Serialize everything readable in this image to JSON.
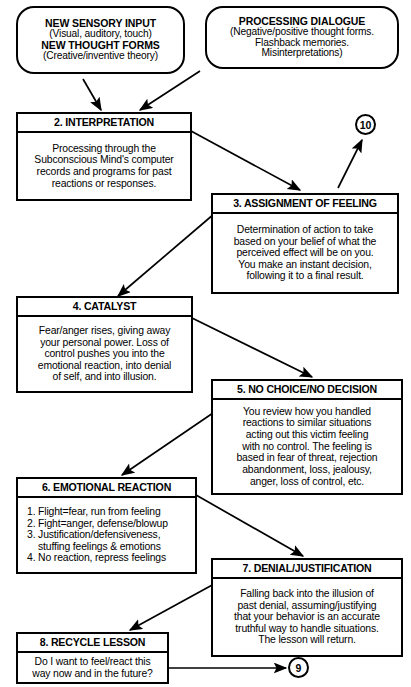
{
  "diagram": {
    "background": "#ffffff",
    "line_color": "#000000"
  },
  "inputs": [
    {
      "id": "new-sensory-input",
      "lines": [
        {
          "text": "NEW SENSORY INPUT",
          "style": "strong"
        },
        {
          "text": "(Visual, auditory, touch)",
          "style": "plain"
        },
        {
          "text": "NEW THOUGHT FORMS",
          "style": "strong"
        },
        {
          "text": "(Creative/inventive theory)",
          "style": "plain"
        }
      ]
    },
    {
      "id": "processing-dialogue",
      "lines": [
        {
          "text": "PROCESSING DIALOGUE",
          "style": "strong"
        },
        {
          "text": "(Negative/positive thought forms.",
          "style": "plain"
        },
        {
          "text": "Flashback memories.",
          "style": "plain"
        },
        {
          "text": "Misinterpretations)",
          "style": "plain"
        }
      ]
    }
  ],
  "steps": [
    {
      "id": "step-2",
      "number": "2",
      "title": "2. INTERPRETATION",
      "body": [
        "Processing through the",
        "Subconscious Mind's computer",
        "records and programs for past",
        "reactions or responses."
      ]
    },
    {
      "id": "step-3",
      "number": "3",
      "title": "3. ASSIGNMENT OF FEELING",
      "body": [
        "Determination of action to take",
        "based on your belief of what the",
        "perceived effect will be on you.",
        "You make an instant decision,",
        "following it to a final result."
      ]
    },
    {
      "id": "step-4",
      "number": "4",
      "title": "4. CATALYST",
      "body": [
        "Fear/anger rises, giving away",
        "your personal power. Loss of",
        "control pushes you into the",
        "emotional reaction, into denial",
        "of self, and into illusion."
      ]
    },
    {
      "id": "step-5",
      "number": "5",
      "title": "5. NO CHOICE/NO DECISION",
      "body": [
        "You review how you handled",
        "reactions to similar situations",
        "acting out this victim feeling",
        "with no control. The feeling is",
        "based in fear of threat, rejection",
        "abandonment, loss, jealousy,",
        "anger, loss of control, etc."
      ]
    },
    {
      "id": "step-6",
      "number": "6",
      "title": "6. EMOTIONAL REACTION",
      "body": [
        "1. Flight=fear, run from feeling",
        "2. Fight=anger, defense/blowup",
        "3. Justification/defensiveness,",
        "stuffing feelings & emotions",
        "4. No reaction, repress feelings"
      ]
    },
    {
      "id": "step-7",
      "number": "7",
      "title": "7. DENIAL/JUSTIFICATION",
      "body": [
        "Falling back into the illusion of",
        "past denial, assuming/justifying",
        "that your behavior is an accurate",
        "truthful way to handle situations.",
        "The lesson will return."
      ]
    },
    {
      "id": "step-8",
      "number": "8",
      "title": "8. RECYCLE LESSON",
      "body": [
        "Do I want to feel/react this",
        "way now and in the future?"
      ]
    }
  ],
  "references": [
    {
      "id": "ref-10",
      "label": "10"
    },
    {
      "id": "ref-9",
      "label": "9"
    }
  ],
  "connections": [
    {
      "from": "new-sensory-input",
      "to": "step-2"
    },
    {
      "from": "processing-dialogue",
      "to": "step-2"
    },
    {
      "from": "step-2",
      "to": "step-3"
    },
    {
      "from": "step-3",
      "to": "ref-10"
    },
    {
      "from": "step-3",
      "to": "step-4"
    },
    {
      "from": "step-4",
      "to": "step-5"
    },
    {
      "from": "step-5",
      "to": "step-6"
    },
    {
      "from": "step-6",
      "to": "step-7"
    },
    {
      "from": "step-7",
      "to": "step-8"
    },
    {
      "from": "step-8",
      "to": "ref-9"
    }
  ]
}
